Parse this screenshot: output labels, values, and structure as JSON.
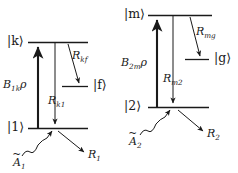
{
  "figure": {
    "kind": "energy-level-diagram-pair",
    "background_color": "#ffffff",
    "ink_color": "#1a1a1a",
    "width": 238,
    "height": 173
  },
  "left_diagram": {
    "name": "three-level-scheme-1",
    "levels": [
      {
        "id": "k",
        "label": "|k⟩",
        "ket_inner": "k",
        "energy": "upper"
      },
      {
        "id": "f",
        "label": "|f⟩",
        "ket_inner": "f",
        "energy": "middle"
      },
      {
        "id": "1",
        "label": "|1⟩",
        "ket_inner": "1",
        "energy": "lower"
      }
    ],
    "transitions": [
      {
        "id": "pump-1k",
        "label_base": "B",
        "label_sub": "1k",
        "label_tail": "ρ",
        "label_full": "B1kρ",
        "direction": "up",
        "from": "1",
        "to": "k"
      },
      {
        "id": "decay-kf",
        "label_base": "R",
        "label_sub": "kf",
        "label_full": "Rkf",
        "direction": "down",
        "from": "k",
        "to": "f"
      },
      {
        "id": "decay-k1",
        "label_base": "R",
        "label_sub": "k1",
        "label_full": "Rk1",
        "direction": "down",
        "from": "k",
        "to": "1"
      }
    ],
    "external": [
      {
        "id": "source-A1",
        "label_base": "A",
        "label_sub": "1",
        "label_accent": "~",
        "label_full": "Ã₁",
        "style": "wavy-arrow-in"
      },
      {
        "id": "loss-R1",
        "label_base": "R",
        "label_sub": "1",
        "label_full": "R₁",
        "style": "straight-arrow-out"
      }
    ]
  },
  "right_diagram": {
    "name": "three-level-scheme-2",
    "levels": [
      {
        "id": "m",
        "label": "|m⟩",
        "ket_inner": "m",
        "energy": "upper"
      },
      {
        "id": "g",
        "label": "|g⟩",
        "ket_inner": "g",
        "energy": "middle"
      },
      {
        "id": "2",
        "label": "|2⟩",
        "ket_inner": "2",
        "energy": "lower"
      }
    ],
    "transitions": [
      {
        "id": "pump-2m",
        "label_base": "B",
        "label_sub": "2m",
        "label_tail": "ρ",
        "label_full": "B2mρ",
        "direction": "up",
        "from": "2",
        "to": "m"
      },
      {
        "id": "decay-mg",
        "label_base": "R",
        "label_sub": "mg",
        "label_full": "Rmg",
        "direction": "down",
        "from": "m",
        "to": "g"
      },
      {
        "id": "decay-m2",
        "label_base": "R",
        "label_sub": "m2",
        "label_full": "Rm2",
        "direction": "down",
        "from": "m",
        "to": "2"
      }
    ],
    "external": [
      {
        "id": "source-A2",
        "label_base": "A",
        "label_sub": "2",
        "label_accent": "~",
        "label_full": "Ã₂",
        "style": "wavy-arrow-in"
      },
      {
        "id": "loss-R2",
        "label_base": "R",
        "label_sub": "2",
        "label_full": "R₂",
        "style": "straight-arrow-out"
      }
    ]
  }
}
